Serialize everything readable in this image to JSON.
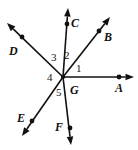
{
  "figure": {
    "width": 138,
    "height": 150,
    "background": "#ffffff",
    "ink_color": "#111111"
  },
  "vertex": {
    "label": "G",
    "x": 63,
    "y": 77,
    "label_x": 70,
    "label_y": 84
  },
  "rays": [
    {
      "id": "ray-a",
      "label": "A",
      "from": {
        "x": 63,
        "y": 77
      },
      "dot": {
        "x": 119,
        "y": 77
      },
      "tip": {
        "x": 134,
        "y": 77
      },
      "label_x": 115,
      "label_y": 82,
      "direction": "right"
    },
    {
      "id": "ray-b",
      "label": "B",
      "from": {
        "x": 63,
        "y": 77
      },
      "dot": {
        "x": 99,
        "y": 31
      },
      "tip": {
        "x": 110,
        "y": 17
      },
      "label_x": 104,
      "label_y": 31,
      "direction": "up-right"
    },
    {
      "id": "ray-c",
      "label": "C",
      "from": {
        "x": 63,
        "y": 77
      },
      "dot": {
        "x": 67,
        "y": 24
      },
      "tip": {
        "x": 68,
        "y": 8
      },
      "label_x": 71,
      "label_y": 17,
      "direction": "up"
    },
    {
      "id": "ray-d",
      "label": "D",
      "from": {
        "x": 63,
        "y": 77
      },
      "dot": {
        "x": 22,
        "y": 37
      },
      "tip": {
        "x": 7,
        "y": 23
      },
      "label_x": 9,
      "label_y": 45,
      "direction": "up-left"
    },
    {
      "id": "ray-e",
      "label": "E",
      "from": {
        "x": 63,
        "y": 77
      },
      "dot": {
        "x": 32,
        "y": 121
      },
      "tip": {
        "x": 22,
        "y": 136
      },
      "label_x": 17,
      "label_y": 112,
      "direction": "down-left"
    },
    {
      "id": "ray-f",
      "label": "F",
      "from": {
        "x": 63,
        "y": 77
      },
      "dot": {
        "x": 70,
        "y": 128
      },
      "tip": {
        "x": 71,
        "y": 145
      },
      "label_x": 55,
      "label_y": 121,
      "direction": "down"
    }
  ],
  "angles": [
    {
      "id": "angle-1",
      "label": "1",
      "between": "GA-GB",
      "x": 76,
      "y": 63
    },
    {
      "id": "angle-2",
      "label": "2",
      "between": "GB-GC",
      "x": 64,
      "y": 50
    },
    {
      "id": "angle-3",
      "label": "3",
      "between": "GC-GD",
      "x": 51,
      "y": 52
    },
    {
      "id": "angle-4",
      "label": "4",
      "between": "GD-GE",
      "x": 47,
      "y": 72
    },
    {
      "id": "angle-5",
      "label": "5",
      "between": "GE-GF",
      "x": 56,
      "y": 87
    }
  ]
}
